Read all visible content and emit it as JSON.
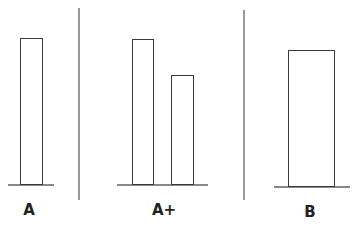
{
  "panels": [
    {
      "label": "A",
      "bars": [
        {
          "height_rel": 1.0
        }
      ]
    },
    {
      "label": "A+",
      "bars": [
        {
          "height_rel": 1.0
        },
        {
          "height_rel": 0.75
        }
      ]
    },
    {
      "label": "B",
      "bars": [
        {
          "height_rel": 0.93
        }
      ]
    }
  ],
  "colors": {
    "bar_outline": "#3a3a3a",
    "baseline": "#8a8a8a",
    "divider": "#9a9a9a"
  }
}
